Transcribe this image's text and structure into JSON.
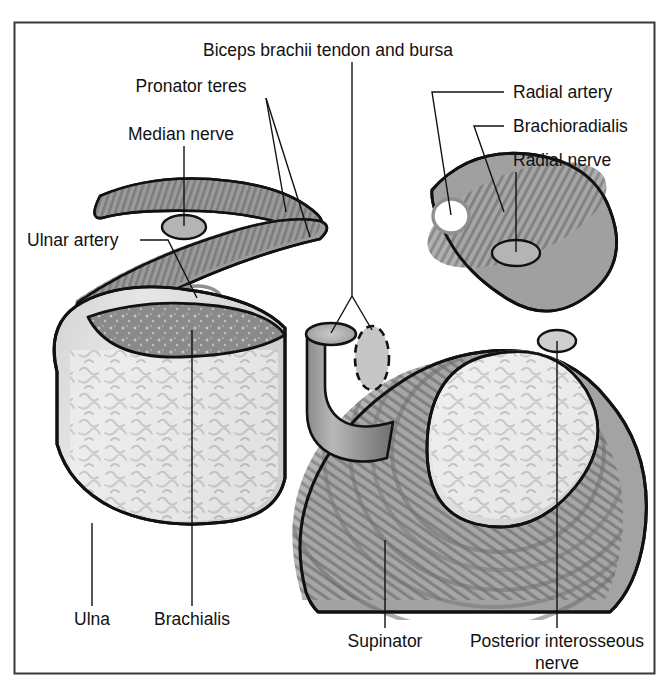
{
  "figure": {
    "type": "anatomical-cross-section",
    "region": "proximal forearm / elbow transverse section",
    "background_color": "#ffffff",
    "frame_color": "#3a3a3a",
    "line_color": "#111111",
    "label_color": "#111111"
  },
  "labels": {
    "biceps_tendon_bursa": "Biceps brachii tendon and bursa",
    "pronator_teres": "Pronator teres",
    "median_nerve": "Median nerve",
    "ulnar_artery": "Ulnar artery",
    "radial_artery": "Radial artery",
    "brachioradialis": "Brachioradialis",
    "radial_nerve": "Radial nerve",
    "ulna": "Ulna",
    "brachialis": "Brachialis",
    "supinator": "Supinator",
    "posterior_interosseous_nerve_line1": "Posterior interosseous",
    "posterior_interosseous_nerve_line2": "nerve"
  },
  "structures": [
    {
      "name": "pronator-teres-upper-band",
      "label": "Pronator teres",
      "fill": "#8e8e8e",
      "kind": "muscle-belly"
    },
    {
      "name": "pronator-teres-lower-band",
      "label": "Pronator teres",
      "fill": "#8e8e8e",
      "kind": "muscle-belly"
    },
    {
      "name": "median-nerve",
      "label": "Median nerve",
      "fill": "#b4b4b4",
      "kind": "nerve-filled-ellipse"
    },
    {
      "name": "ulnar-artery",
      "label": "Ulnar artery",
      "fill": "#ffffff",
      "kind": "vessel-open-ellipse"
    },
    {
      "name": "radial-artery",
      "label": "Radial artery",
      "fill": "#ffffff",
      "kind": "vessel-open-ellipse"
    },
    {
      "name": "brachioradialis",
      "label": "Brachioradialis",
      "fill": "#9a9a9a",
      "kind": "muscle-belly-striated"
    },
    {
      "name": "radial-nerve",
      "label": "Radial nerve",
      "fill": "#b4b4b4",
      "kind": "nerve-filled-ellipse"
    },
    {
      "name": "ulna",
      "label": "Ulna",
      "fill": "#dcdcdc",
      "kind": "bone-cross-section-trabecular"
    },
    {
      "name": "brachialis",
      "label": "Brachialis",
      "fill": "#8a8a8a",
      "kind": "muscle-wedge"
    },
    {
      "name": "biceps-brachii-tendon",
      "label": "Biceps brachii tendon and bursa",
      "fill": "#9d9d9d",
      "kind": "tendon-cylinder"
    },
    {
      "name": "biceps-bursa",
      "label": "Biceps brachii tendon and bursa",
      "fill": "#c8c8c8",
      "kind": "bursa-dashed-ellipse"
    },
    {
      "name": "radius",
      "label": "Radius",
      "fill": "#e2e2e2",
      "kind": "bone-cross-section-trabecular"
    },
    {
      "name": "supinator",
      "label": "Supinator",
      "fill": "#9a9a9a",
      "kind": "muscle-wrap-striated"
    },
    {
      "name": "posterior-interosseous-nerve",
      "label": "Posterior interosseous nerve",
      "fill": "#d2d2d2",
      "kind": "nerve-open-ellipse"
    }
  ]
}
